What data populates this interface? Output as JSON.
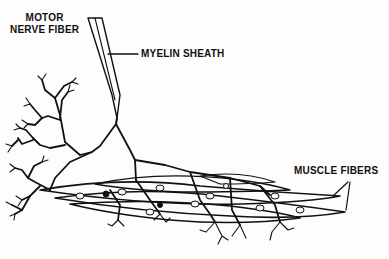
{
  "diagram": {
    "labels": {
      "motor_nerve_line1": "MOTOR",
      "motor_nerve_line2": "NERVE FIBER",
      "myelin_sheath": "MYELIN SHEATH",
      "muscle_fibers": "MUSCLE FIBERS"
    },
    "colors": {
      "ink": "#111111",
      "background": "#fdfdfd",
      "stipple_fill": "#e6e6e6"
    }
  }
}
